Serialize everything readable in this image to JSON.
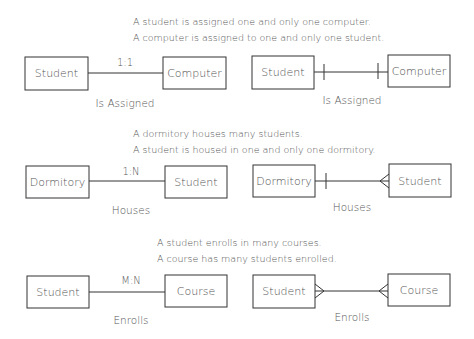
{
  "sections": [
    {
      "id": "one-to-one",
      "description": [
        "A student is assigned one and only one computer.",
        "A computer is assigned to one and only one student."
      ],
      "left": {
        "entity_a": "Student",
        "entity_b": "Computer",
        "cardinality": "1:1",
        "relationship": "Is Assigned"
      },
      "right": {
        "entity_a": "Student",
        "entity_b": "Computer",
        "relationship": "Is Assigned",
        "end_a": "one",
        "end_b": "one"
      }
    },
    {
      "id": "one-to-many",
      "description": [
        "A dormitory houses many students.",
        "A student is housed in one and only one dormitory."
      ],
      "left": {
        "entity_a": "Dormitory",
        "entity_b": "Student",
        "cardinality": "1:N",
        "relationship": "Houses"
      },
      "right": {
        "entity_a": "Dormitory",
        "entity_b": "Student",
        "relationship": "Houses",
        "end_a": "one",
        "end_b": "many"
      }
    },
    {
      "id": "many-to-many",
      "description": [
        "A student enrolls in many courses.",
        "A course has many students enrolled."
      ],
      "left": {
        "entity_a": "Student",
        "entity_b": "Course",
        "cardinality": "M:N",
        "relationship": "Enrolls"
      },
      "right": {
        "entity_a": "Student",
        "entity_b": "Course",
        "relationship": "Enrolls",
        "end_a": "many",
        "end_b": "many"
      }
    }
  ]
}
